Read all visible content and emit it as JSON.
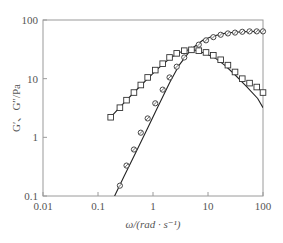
{
  "chart_data": {
    "type": "scatter",
    "title": "",
    "xlabel": "ω/(rad · s⁻¹)",
    "ylabel": "G′、G″/Pa",
    "xscale": "log",
    "yscale": "log",
    "xlim": [
      0.01,
      100
    ],
    "ylim": [
      0.1,
      100
    ],
    "xticks": [
      0.01,
      0.1,
      1,
      10,
      100
    ],
    "xtick_labels": [
      "0.01",
      "0.1",
      "1",
      "10",
      "100"
    ],
    "yticks": [
      0.1,
      1,
      10,
      100
    ],
    "ytick_labels": [
      "0.1",
      "1",
      "10",
      "100"
    ],
    "grid": false,
    "legend": null,
    "series": [
      {
        "name": "G′ (storage modulus)",
        "marker": "circle",
        "line": "connected-fit",
        "x": [
          0.25,
          0.33,
          0.45,
          0.6,
          0.8,
          1.1,
          1.5,
          2.0,
          2.7,
          3.7,
          5.0,
          6.8,
          9.2,
          12.5,
          17,
          23,
          31,
          42,
          57,
          77,
          100
        ],
        "y": [
          0.15,
          0.33,
          0.62,
          1.2,
          2.1,
          3.8,
          6.5,
          10.5,
          16,
          23,
          31,
          38,
          45,
          51,
          56,
          59,
          61,
          63,
          64,
          64,
          64
        ]
      },
      {
        "name": "G″ (loss modulus)",
        "marker": "square",
        "x": [
          0.17,
          0.25,
          0.33,
          0.45,
          0.6,
          0.8,
          1.1,
          1.5,
          2.0,
          2.7,
          3.7,
          5.0,
          6.8,
          9.2,
          12.5,
          17,
          23,
          31,
          42,
          57,
          77,
          100
        ],
        "y": [
          2.2,
          3.2,
          4.3,
          5.8,
          7.8,
          10.5,
          14,
          18,
          23,
          27,
          30,
          31,
          30,
          28,
          25,
          21,
          17,
          13,
          10,
          8.4,
          7.2,
          5.8
        ]
      },
      {
        "name": "G′ Maxwell fit",
        "type": "line",
        "x": [
          0.2,
          0.3,
          0.5,
          0.8,
          1.2,
          2,
          3,
          5,
          8,
          12,
          20,
          30,
          50,
          80,
          100
        ],
        "y": [
          0.1,
          0.22,
          0.58,
          1.45,
          3.2,
          8.5,
          17,
          32,
          45,
          53,
          59,
          62,
          63.5,
          64,
          64
        ]
      },
      {
        "name": "G″ Maxwell fit",
        "type": "line",
        "x": [
          0.17,
          0.3,
          0.5,
          0.8,
          1.2,
          2,
          3,
          4.5,
          6,
          9,
          14,
          20,
          30,
          50,
          80,
          100
        ],
        "y": [
          2.2,
          3.9,
          6.4,
          10,
          14.5,
          22,
          28,
          31,
          30.5,
          27,
          22,
          17,
          12,
          7.4,
          4.6,
          3.2
        ]
      }
    ]
  },
  "plot": {
    "left": 43,
    "right": 263,
    "top": 20,
    "bottom": 196,
    "line_color": "#222222",
    "frame_color": "#999999"
  }
}
